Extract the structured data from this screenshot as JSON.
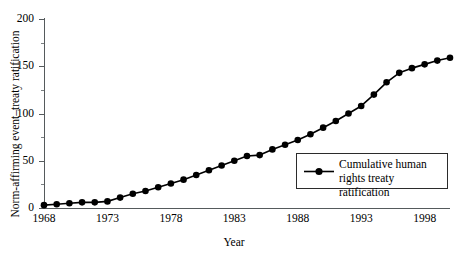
{
  "chart_data": {
    "type": "line",
    "title": "",
    "xlabel": "Year",
    "ylabel": "Norm-affirming event–treaty ratification",
    "xlim": [
      1968,
      2000
    ],
    "ylim": [
      0,
      200
    ],
    "grid": false,
    "legend_position": "inside-right",
    "x_ticks": [
      "1968",
      "1973",
      "1978",
      "1983",
      "1988",
      "1993",
      "1998"
    ],
    "x_tick_values": [
      1968,
      1973,
      1978,
      1983,
      1988,
      1993,
      1998
    ],
    "y_ticks": [
      "0",
      "50",
      "100",
      "150",
      "200"
    ],
    "y_tick_values": [
      0,
      50,
      100,
      150,
      200
    ],
    "y_minor_tick_values": [
      25,
      75,
      125,
      175
    ],
    "marker": "filled-circle",
    "line_color": "#000000",
    "marker_color": "#000000",
    "series": [
      {
        "name": "Cumulative human rights treaty ratification",
        "x": [
          1968,
          1969,
          1970,
          1971,
          1972,
          1973,
          1974,
          1975,
          1976,
          1977,
          1978,
          1979,
          1980,
          1981,
          1982,
          1983,
          1984,
          1985,
          1986,
          1987,
          1988,
          1989,
          1990,
          1991,
          1992,
          1993,
          1994,
          1995,
          1996,
          1997,
          1998,
          1999,
          2000
        ],
        "values": [
          3,
          4,
          5,
          6,
          6,
          7,
          11,
          15,
          18,
          22,
          26,
          30,
          35,
          40,
          45,
          50,
          55,
          56,
          62,
          67,
          72,
          78,
          85,
          92,
          100,
          108,
          120,
          133,
          143,
          148,
          152,
          156,
          159
        ]
      }
    ],
    "legend": [
      {
        "label_line1": "Cumulative human",
        "label_line2": "rights treaty ratification",
        "symbol": "line-with-circle-marker"
      }
    ]
  }
}
